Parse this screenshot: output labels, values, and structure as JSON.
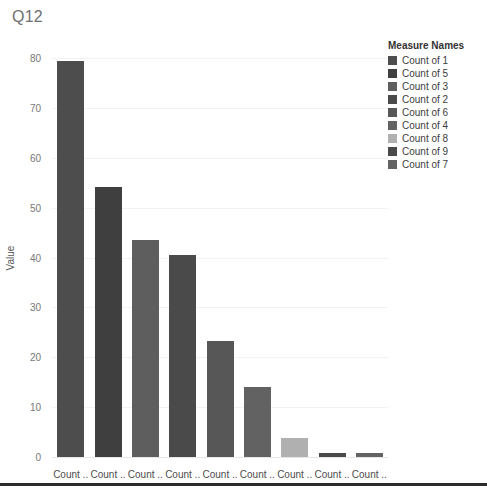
{
  "title": "Q12",
  "chart_data": {
    "type": "bar",
    "title": "Q12",
    "xlabel": "",
    "ylabel": "Value",
    "ylim": [
      0,
      80
    ],
    "yticks": [
      0,
      10,
      20,
      30,
      40,
      50,
      60,
      70,
      80
    ],
    "grid": true,
    "legend_position": "right",
    "categories": [
      "Count ..",
      "Count ..",
      "Count ..",
      "Count ..",
      "Count ..",
      "Count ..",
      "Count ..",
      "Count ..",
      "Count .."
    ],
    "series_names": [
      "Count of 1",
      "Count of 5",
      "Count of 3",
      "Count of 2",
      "Count of 6",
      "Count of 4",
      "Count of 8",
      "Count of 9",
      "Count of 7"
    ],
    "values": [
      79.5,
      54.2,
      43.5,
      40.5,
      23.2,
      14.1,
      3.8,
      0.9,
      0.9
    ],
    "bar_colors": [
      "#4d4d4d",
      "#3f3f3f",
      "#5e5e5e",
      "#4a4a4a",
      "#575757",
      "#626262",
      "#b0b0b0",
      "#4a4a4a",
      "#636363"
    ]
  },
  "y_axis": {
    "label": "Value",
    "ticks": [
      "80",
      "70",
      "60",
      "50",
      "40",
      "30",
      "20",
      "10",
      "0"
    ]
  },
  "x_axis": {
    "labels": [
      "Count ..",
      "Count ..",
      "Count ..",
      "Count ..",
      "Count ..",
      "Count ..",
      "Count ..",
      "Count ..",
      "Count .."
    ]
  },
  "legend": {
    "title": "Measure Names",
    "items": [
      {
        "label": "Count of 1",
        "color": "#4d4d4d"
      },
      {
        "label": "Count of 5",
        "color": "#3f3f3f"
      },
      {
        "label": "Count of 3",
        "color": "#5e5e5e"
      },
      {
        "label": "Count of 2",
        "color": "#4a4a4a"
      },
      {
        "label": "Count of 6",
        "color": "#575757"
      },
      {
        "label": "Count of 4",
        "color": "#626262"
      },
      {
        "label": "Count of 8",
        "color": "#b0b0b0"
      },
      {
        "label": "Count of 9",
        "color": "#4a4a4a"
      },
      {
        "label": "Count of 7",
        "color": "#636363"
      }
    ]
  }
}
